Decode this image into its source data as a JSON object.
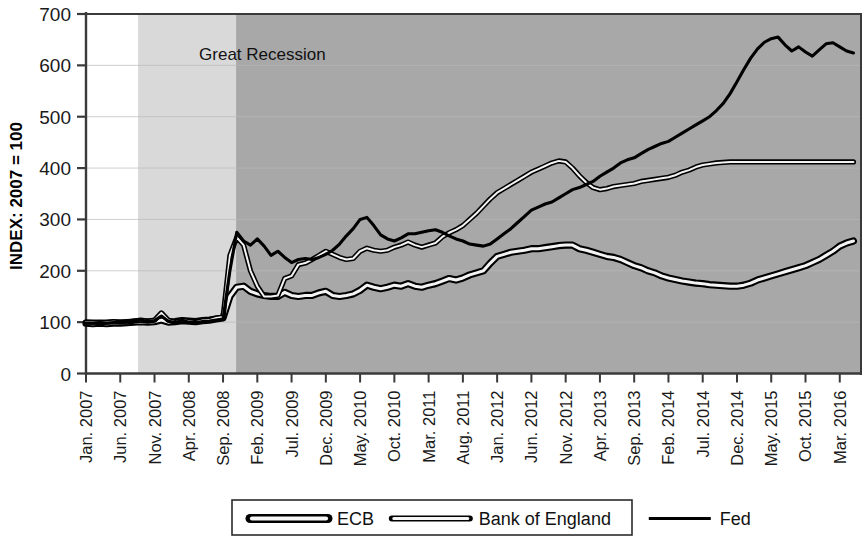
{
  "chart_data": {
    "type": "line",
    "title": "",
    "subtitle": "",
    "xlabel": "",
    "ylabel": "INDEX: 2007 = 100",
    "ylim": [
      0,
      700
    ],
    "yticks": [
      0,
      100,
      200,
      300,
      400,
      500,
      600,
      700
    ],
    "ytick_labels": [
      "0",
      "100",
      "200",
      "300",
      "400",
      "500",
      "600",
      "700"
    ],
    "grid": true,
    "grid_axis": "y",
    "legend_position": "bottom",
    "annotations": [
      {
        "text": "Great Recession",
        "x_index": 3.3,
        "y": 610
      }
    ],
    "shaded_bands": [
      {
        "label": "pre-recession",
        "color": "#ffffff",
        "from_index": 0.0,
        "to_index": 1.52
      },
      {
        "label": "early-recession",
        "color": "#d9d9d9",
        "from_index": 1.52,
        "to_index": 4.38
      },
      {
        "label": "post-crisis",
        "color": "#a8a8a8",
        "from_index": 4.38,
        "to_index": 22.6
      }
    ],
    "xtick_labels": [
      "Jan. 2007",
      "Jun. 2007",
      "Nov. 2007",
      "Apr. 2008",
      "Sep. 2008",
      "Feb. 2009",
      "Jul. 2009",
      "Dec. 2009",
      "May. 2010",
      "Oct. 2010",
      "Mar. 2011",
      "Aug. 2011",
      "Jan. 2012",
      "Jun. 2012",
      "Nov. 2012",
      "Apr. 2013",
      "Sep. 2013",
      "Feb. 2014",
      "Jul. 2014",
      "Dec. 2014",
      "May. 2015",
      "Oct. 2015",
      "Mar. 2016"
    ],
    "x_months": [
      "Jan. 2007",
      "Feb. 2007",
      "Mar. 2007",
      "Apr. 2007",
      "May. 2007",
      "Jun. 2007",
      "Jul. 2007",
      "Aug. 2007",
      "Sep. 2007",
      "Oct. 2007",
      "Nov. 2007",
      "Dec. 2007",
      "Jan. 2008",
      "Feb. 2008",
      "Mar. 2008",
      "Apr. 2008",
      "May. 2008",
      "Jun. 2008",
      "Jul. 2008",
      "Aug. 2008",
      "Sep. 2008",
      "Oct. 2008",
      "Nov. 2008",
      "Dec. 2008",
      "Jan. 2009",
      "Feb. 2009",
      "Mar. 2009",
      "Apr. 2009",
      "May. 2009",
      "Jun. 2009",
      "Jul. 2009",
      "Aug. 2009",
      "Sep. 2009",
      "Oct. 2009",
      "Nov. 2009",
      "Dec. 2009",
      "Jan. 2010",
      "Feb. 2010",
      "Mar. 2010",
      "Apr. 2010",
      "May. 2010",
      "Jun. 2010",
      "Jul. 2010",
      "Aug. 2010",
      "Sep. 2010",
      "Oct. 2010",
      "Nov. 2010",
      "Dec. 2010",
      "Jan. 2011",
      "Feb. 2011",
      "Mar. 2011",
      "Apr. 2011",
      "May. 2011",
      "Jun. 2011",
      "Jul. 2011",
      "Aug. 2011",
      "Sep. 2011",
      "Oct. 2011",
      "Nov. 2011",
      "Dec. 2011",
      "Jan. 2012",
      "Feb. 2012",
      "Mar. 2012",
      "Apr. 2012",
      "May. 2012",
      "Jun. 2012",
      "Jul. 2012",
      "Aug. 2012",
      "Sep. 2012",
      "Oct. 2012",
      "Nov. 2012",
      "Dec. 2012",
      "Jan. 2013",
      "Feb. 2013",
      "Mar. 2013",
      "Apr. 2013",
      "May. 2013",
      "Jun. 2013",
      "Jul. 2013",
      "Aug. 2013",
      "Sep. 2013",
      "Oct. 2013",
      "Nov. 2013",
      "Dec. 2013",
      "Jan. 2014",
      "Feb. 2014",
      "Mar. 2014",
      "Apr. 2014",
      "May. 2014",
      "Jun. 2014",
      "Jul. 2014",
      "Aug. 2014",
      "Sep. 2014",
      "Oct. 2014",
      "Nov. 2014",
      "Dec. 2014",
      "Jan. 2015",
      "Feb. 2015",
      "Mar. 2015",
      "Apr. 2015",
      "May. 2015",
      "Jun. 2015",
      "Jul. 2015",
      "Aug. 2015",
      "Sep. 2015",
      "Oct. 2015",
      "Nov. 2015",
      "Dec. 2015",
      "Jan. 2016",
      "Feb. 2016",
      "Mar. 2016",
      "Apr. 2016",
      "May. 2016"
    ],
    "series": [
      {
        "name": "ECB",
        "style": "thick-outline",
        "color": "#000000",
        "values": [
          98,
          97,
          98,
          97,
          98,
          98,
          99,
          100,
          101,
          100,
          101,
          104,
          100,
          101,
          103,
          102,
          101,
          103,
          104,
          106,
          108,
          150,
          168,
          170,
          160,
          155,
          152,
          150,
          150,
          158,
          152,
          150,
          152,
          152,
          157,
          160,
          152,
          150,
          152,
          155,
          162,
          172,
          168,
          165,
          168,
          172,
          170,
          175,
          170,
          168,
          172,
          175,
          180,
          185,
          182,
          186,
          192,
          196,
          200,
          215,
          228,
          232,
          236,
          238,
          240,
          243,
          243,
          245,
          247,
          249,
          250,
          250,
          243,
          240,
          236,
          232,
          228,
          226,
          222,
          216,
          210,
          206,
          200,
          196,
          190,
          186,
          183,
          180,
          178,
          176,
          175,
          173,
          172,
          171,
          170,
          170,
          172,
          176,
          182,
          186,
          190,
          194,
          198,
          202,
          206,
          210,
          216,
          222,
          230,
          238,
          248,
          254,
          258
        ]
      },
      {
        "name": "Bank of England",
        "style": "thin-outline",
        "color": "#000000",
        "values": [
          100,
          100,
          99,
          100,
          101,
          100,
          100,
          102,
          104,
          102,
          104,
          118,
          104,
          100,
          104,
          102,
          100,
          103,
          104,
          108,
          110,
          230,
          265,
          250,
          200,
          170,
          150,
          150,
          152,
          185,
          190,
          212,
          215,
          222,
          230,
          238,
          232,
          226,
          222,
          224,
          238,
          244,
          240,
          238,
          240,
          246,
          250,
          256,
          250,
          246,
          250,
          254,
          266,
          274,
          280,
          288,
          300,
          312,
          326,
          340,
          352,
          360,
          368,
          376,
          384,
          392,
          398,
          404,
          410,
          414,
          412,
          400,
          385,
          372,
          362,
          358,
          360,
          364,
          366,
          368,
          370,
          374,
          376,
          378,
          380,
          382,
          386,
          392,
          396,
          402,
          406,
          408,
          410,
          411,
          412,
          412,
          412,
          412,
          412,
          412,
          412,
          412,
          412,
          412,
          412,
          412,
          412,
          412,
          412,
          412,
          412,
          412,
          412
        ]
      },
      {
        "name": "Fed",
        "style": "solid",
        "color": "#000000",
        "values": [
          98,
          98,
          99,
          98,
          99,
          99,
          100,
          102,
          104,
          101,
          103,
          112,
          102,
          99,
          104,
          100,
          99,
          101,
          102,
          104,
          106,
          200,
          275,
          258,
          250,
          262,
          248,
          230,
          238,
          226,
          216,
          222,
          224,
          222,
          226,
          232,
          240,
          252,
          268,
          282,
          300,
          304,
          288,
          270,
          262,
          258,
          264,
          272,
          272,
          275,
          278,
          280,
          275,
          268,
          262,
          258,
          252,
          250,
          248,
          252,
          262,
          272,
          282,
          294,
          306,
          318,
          324,
          330,
          334,
          342,
          350,
          358,
          362,
          368,
          374,
          384,
          392,
          400,
          410,
          416,
          420,
          428,
          436,
          442,
          448,
          452,
          460,
          468,
          476,
          484,
          492,
          500,
          512,
          526,
          545,
          568,
          592,
          614,
          632,
          645,
          652,
          655,
          640,
          628,
          636,
          626,
          618,
          630,
          642,
          644,
          636,
          628,
          624
        ]
      }
    ]
  },
  "legend": {
    "items": [
      {
        "label": "ECB",
        "style": "thick-outline"
      },
      {
        "label": "Bank of England",
        "style": "thin-outline"
      },
      {
        "label": "Fed",
        "style": "solid"
      }
    ]
  },
  "axis": {
    "y_title": "INDEX: 2007 = 100"
  }
}
